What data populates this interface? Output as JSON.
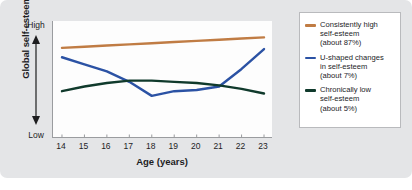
{
  "figure": {
    "background_color": "#e4e5e7",
    "plot_background_color": "#fdfdfd",
    "axis_color": "#9a9c9f"
  },
  "axes": {
    "y_title": "Global self-esteem",
    "y_high_label": "High",
    "y_low_label": "Low",
    "x_title": "Age (years)"
  },
  "legend": {
    "entries": [
      {
        "label": "Consistently high\nself-esteem\n(about 87%)",
        "color": "#c07c44",
        "swatch_name": "legend-swatch-consistently-high"
      },
      {
        "label": "U-shaped changes\nin self-esteem\n(about 7%)",
        "color": "#2b52a4",
        "swatch_name": "legend-swatch-u-shaped"
      },
      {
        "label": "Chronically low\nself-esteem\n(about 5%)",
        "color": "#103a2c",
        "swatch_name": "legend-swatch-chronically-low"
      }
    ]
  },
  "chart_data": {
    "type": "line",
    "title": "",
    "xlabel": "Age (years)",
    "ylabel": "Global self-esteem",
    "x": [
      14,
      15,
      16,
      17,
      18,
      19,
      20,
      21,
      22,
      23
    ],
    "xtick_labels": [
      "14",
      "15",
      "16",
      "17",
      "18",
      "19",
      "20",
      "21",
      "22",
      "23"
    ],
    "xlim": [
      13.6,
      23.4
    ],
    "ylim": [
      0,
      100
    ],
    "ytick_labels": [
      "Low",
      "High"
    ],
    "grid": false,
    "legend_position": "right-outside",
    "series": [
      {
        "name": "Consistently high self-esteem (about 87%)",
        "color": "#c07c44",
        "percent": 87,
        "values": [
          77,
          78,
          79,
          80,
          81,
          82,
          83,
          84,
          85,
          86
        ]
      },
      {
        "name": "U-shaped changes in self-esteem (about 7%)",
        "color": "#2b52a4",
        "percent": 7,
        "values": [
          69,
          63,
          57,
          48,
          36,
          40,
          41,
          44,
          59,
          76
        ]
      },
      {
        "name": "Chronically low self-esteem (about 5%)",
        "color": "#103a2c",
        "percent": 5,
        "values": [
          40,
          44,
          47,
          49,
          49,
          48,
          47,
          45,
          42,
          38
        ]
      }
    ]
  }
}
